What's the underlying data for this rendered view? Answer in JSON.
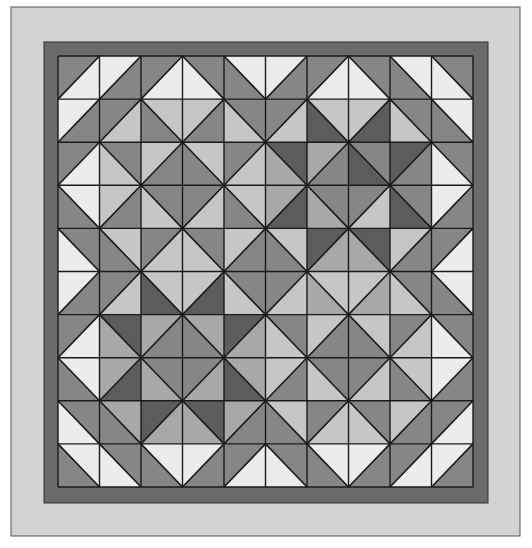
{
  "quilt": {
    "canvas": {
      "width": 532,
      "height": 548,
      "background": "#ffffff"
    },
    "outer_border": {
      "x": 11,
      "y": 7,
      "w": 509,
      "h": 529,
      "fill": "#d2d2d2",
      "stroke": "#555555"
    },
    "inner_border": {
      "x": 44,
      "y": 42,
      "w": 444,
      "h": 461,
      "fill": "#6b6b6b",
      "stroke": "#333333"
    },
    "grid": {
      "x": 58,
      "y": 56,
      "w": 415,
      "h": 431,
      "cols": 10,
      "rows": 10,
      "line_color": "#1a1a1a"
    },
    "palette": {
      "W": "#ececec",
      "L": "#c6c6c6",
      "ML": "#a8a8a8",
      "M": "#868686",
      "D": "#5c5c5c"
    },
    "legend_note": "Each cell: [diagonal, colorA, colorB]. '/' → A=upper-left, B=lower-right. '\\' → A=upper-right, B=lower-left.",
    "cells": [
      [
        [
          "/",
          "M",
          "W"
        ],
        [
          "/",
          "W",
          "M"
        ],
        [
          "/",
          "M",
          "W"
        ],
        [
          "\\",
          "M",
          "W"
        ],
        [
          "\\",
          "W",
          "M"
        ],
        [
          "/",
          "W",
          "M"
        ],
        [
          "/",
          "M",
          "W"
        ],
        [
          "\\",
          "M",
          "W"
        ],
        [
          "\\",
          "W",
          "M"
        ],
        [
          "\\",
          "M",
          "W"
        ]
      ],
      [
        [
          "/",
          "W",
          "M"
        ],
        [
          "/",
          "M",
          "L"
        ],
        [
          "\\",
          "L",
          "M"
        ],
        [
          "/",
          "L",
          "M"
        ],
        [
          "\\",
          "M",
          "L"
        ],
        [
          "/",
          "M",
          "L"
        ],
        [
          "\\",
          "L",
          "D"
        ],
        [
          "/",
          "L",
          "D"
        ],
        [
          "\\",
          "M",
          "L"
        ],
        [
          "\\",
          "W",
          "M"
        ]
      ],
      [
        [
          "/",
          "M",
          "W"
        ],
        [
          "\\",
          "M",
          "L"
        ],
        [
          "/",
          "L",
          "M"
        ],
        [
          "\\",
          "L",
          "M"
        ],
        [
          "/",
          "M",
          "L"
        ],
        [
          "\\",
          "D",
          "ML"
        ],
        [
          "/",
          "ML",
          "M"
        ],
        [
          "\\",
          "M",
          "D"
        ],
        [
          "/",
          "D",
          "M"
        ],
        [
          "\\",
          "M",
          "W"
        ]
      ],
      [
        [
          "\\",
          "W",
          "M"
        ],
        [
          "/",
          "L",
          "M"
        ],
        [
          "\\",
          "M",
          "L"
        ],
        [
          "/",
          "M",
          "L"
        ],
        [
          "\\",
          "L",
          "M"
        ],
        [
          "/",
          "ML",
          "D"
        ],
        [
          "\\",
          "M",
          "ML"
        ],
        [
          "/",
          "M",
          "L"
        ],
        [
          "\\",
          "M",
          "D"
        ],
        [
          "/",
          "W",
          "M"
        ]
      ],
      [
        [
          "\\",
          "M",
          "W"
        ],
        [
          "\\",
          "L",
          "M"
        ],
        [
          "/",
          "M",
          "L"
        ],
        [
          "\\",
          "M",
          "L"
        ],
        [
          "/",
          "L",
          "M"
        ],
        [
          "\\",
          "L",
          "M"
        ],
        [
          "/",
          "D",
          "ML"
        ],
        [
          "\\",
          "D",
          "ML"
        ],
        [
          "/",
          "L",
          "M"
        ],
        [
          "/",
          "M",
          "W"
        ]
      ],
      [
        [
          "/",
          "W",
          "M"
        ],
        [
          "/",
          "M",
          "L"
        ],
        [
          "\\",
          "L",
          "D"
        ],
        [
          "/",
          "L",
          "D"
        ],
        [
          "\\",
          "M",
          "L"
        ],
        [
          "/",
          "M",
          "L"
        ],
        [
          "\\",
          "L",
          "ML"
        ],
        [
          "/",
          "L",
          "ML"
        ],
        [
          "\\",
          "M",
          "L"
        ],
        [
          "\\",
          "W",
          "M"
        ]
      ],
      [
        [
          "/",
          "M",
          "W"
        ],
        [
          "\\",
          "D",
          "ML"
        ],
        [
          "/",
          "ML",
          "M"
        ],
        [
          "\\",
          "ML",
          "M"
        ],
        [
          "/",
          "D",
          "ML"
        ],
        [
          "\\",
          "M",
          "L"
        ],
        [
          "/",
          "L",
          "M"
        ],
        [
          "\\",
          "L",
          "M"
        ],
        [
          "/",
          "M",
          "L"
        ],
        [
          "\\",
          "M",
          "W"
        ]
      ],
      [
        [
          "\\",
          "W",
          "M"
        ],
        [
          "/",
          "ML",
          "D"
        ],
        [
          "\\",
          "M",
          "ML"
        ],
        [
          "/",
          "M",
          "ML"
        ],
        [
          "\\",
          "ML",
          "D"
        ],
        [
          "/",
          "L",
          "M"
        ],
        [
          "\\",
          "M",
          "L"
        ],
        [
          "/",
          "M",
          "L"
        ],
        [
          "\\",
          "L",
          "M"
        ],
        [
          "/",
          "W",
          "M"
        ]
      ],
      [
        [
          "\\",
          "M",
          "W"
        ],
        [
          "\\",
          "ML",
          "M"
        ],
        [
          "/",
          "D",
          "ML"
        ],
        [
          "\\",
          "D",
          "ML"
        ],
        [
          "/",
          "ML",
          "M"
        ],
        [
          "\\",
          "L",
          "M"
        ],
        [
          "/",
          "M",
          "L"
        ],
        [
          "\\",
          "M",
          "L"
        ],
        [
          "/",
          "L",
          "M"
        ],
        [
          "/",
          "M",
          "W"
        ]
      ],
      [
        [
          "\\",
          "W",
          "M"
        ],
        [
          "\\",
          "M",
          "W"
        ],
        [
          "\\",
          "W",
          "M"
        ],
        [
          "/",
          "W",
          "M"
        ],
        [
          "/",
          "M",
          "W"
        ],
        [
          "\\",
          "M",
          "W"
        ],
        [
          "\\",
          "W",
          "M"
        ],
        [
          "/",
          "W",
          "M"
        ],
        [
          "/",
          "M",
          "W"
        ],
        [
          "/",
          "W",
          "M"
        ]
      ]
    ]
  }
}
